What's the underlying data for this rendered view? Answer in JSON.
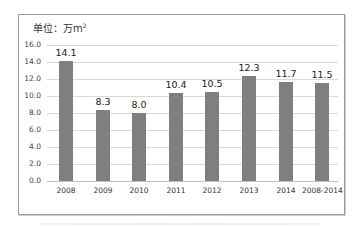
{
  "chart_data": {
    "type": "bar",
    "unit_label": "单位：万m",
    "unit_superscript": "2",
    "xlabel": "",
    "ylabel": "",
    "categories": [
      "2008",
      "2009",
      "2010",
      "2011",
      "2012",
      "2013",
      "2014",
      "2008-2014"
    ],
    "values": [
      14.1,
      8.3,
      8.0,
      10.4,
      10.5,
      12.3,
      11.7,
      11.5
    ],
    "value_labels": [
      "14.1",
      "8.3",
      "8.0",
      "10.4",
      "10.5",
      "12.3",
      "11.7",
      "11.5"
    ],
    "ylim": [
      0,
      16
    ],
    "yticks": [
      "0.0",
      "2.0",
      "4.0",
      "6.0",
      "8.0",
      "10.0",
      "12.0",
      "14.0",
      "16.0"
    ],
    "grid": true,
    "legend": null,
    "colors": {
      "bar": "#7f7f7f",
      "grid": "#d9d9d9",
      "frame": "#9a9a9a"
    }
  }
}
